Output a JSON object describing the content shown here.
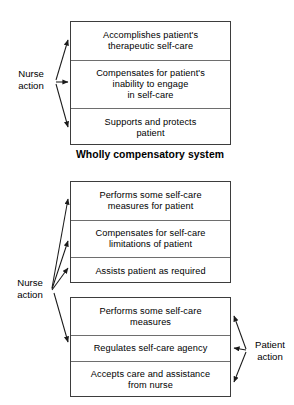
{
  "diagram": {
    "ink_color": "#000000",
    "box_border_color": "#3d3d3d",
    "divider_color": "#6e6e6e",
    "background": "#ffffff"
  },
  "groups": [
    {
      "id": "wholly-compensatory",
      "caption": "Wholly compensatory system",
      "rows": [
        "Accomplishes patient's\ntherapeutic self-care",
        "Compensates for patient's\ninability to engage\nin self-care",
        "Supports and protects\npatient"
      ]
    },
    {
      "id": "partly-compensatory-nurse",
      "caption": "",
      "rows": [
        "Performs some self-care\nmeasures for patient",
        "Compensates for self-care\nlimitations of patient",
        "Assists patient as required"
      ]
    },
    {
      "id": "partly-compensatory-patient",
      "caption": "",
      "rows": [
        "Performs some self-care\nmeasures",
        "Regulates self-care agency",
        "Accepts care and assistance\nfrom nurse"
      ]
    }
  ],
  "labels": {
    "nurse_action_top": "Nurse\naction",
    "nurse_action_bottom": "Nurse\naction",
    "patient_action": "Patient\naction"
  },
  "icons": {
    "arrow": "arrow-head-icon"
  }
}
